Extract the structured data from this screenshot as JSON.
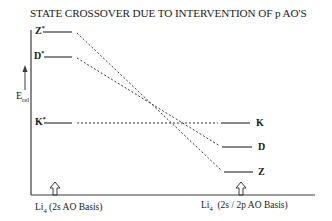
{
  "title": "STATE CROSSOVER DUE TO INTERVENTION OF p AO'S",
  "y_axis": {
    "label_main": "E",
    "label_sub": "rel",
    "arrow": "up-arrow-icon"
  },
  "left_states": [
    {
      "label": "Z",
      "sup": "*",
      "y": 32
    },
    {
      "label": "D",
      "sup": "*",
      "y": 57
    },
    {
      "label": "K",
      "sup": "*",
      "y": 123
    }
  ],
  "right_states": [
    {
      "label": "K",
      "y": 123
    },
    {
      "label": "D",
      "y": 147
    },
    {
      "label": "Z",
      "y": 172
    }
  ],
  "correlations": [
    {
      "from": "Z*",
      "to": "Z"
    },
    {
      "from": "D*",
      "to": "D"
    },
    {
      "from": "K*",
      "to": "K"
    }
  ],
  "x_labels": {
    "left": {
      "main": "Li",
      "sub": "4",
      "rest": " (2s AO Basis)"
    },
    "right": {
      "main": "Li",
      "sub": "4",
      "rest": "  (2s / 2p AO Basis)"
    }
  },
  "colors": {
    "line": "#3a3a3a",
    "text": "#1a1a1a",
    "background": "#ffffff"
  }
}
